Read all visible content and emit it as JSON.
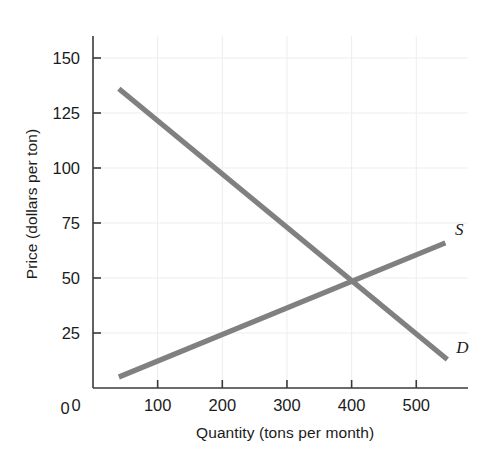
{
  "chart_data": {
    "type": "line",
    "title": "",
    "xlabel": "Quantity (tons per month)",
    "ylabel": "Price (dollars per ton)",
    "xlim": [
      0,
      580
    ],
    "ylim": [
      0,
      160
    ],
    "xticks": [
      "0",
      "100",
      "200",
      "300",
      "400",
      "500"
    ],
    "xtick_values": [
      0,
      100,
      200,
      300,
      400,
      500
    ],
    "yticks": [
      "0",
      "25",
      "50",
      "75",
      "100",
      "125",
      "150"
    ],
    "ytick_values": [
      0,
      25,
      50,
      75,
      100,
      125,
      150
    ],
    "grid": true,
    "legend_position": "inline-end-of-line",
    "series": [
      {
        "name": "S",
        "label": "S",
        "description": "Supply curve",
        "color": "#808080",
        "x": [
          40,
          545
        ],
        "y": [
          5,
          66
        ],
        "label_x": 560,
        "label_y": 72
      },
      {
        "name": "D",
        "label": "D",
        "description": "Demand curve",
        "color": "#808080",
        "x": [
          40,
          548
        ],
        "y": [
          136,
          13
        ],
        "label_x": 562,
        "label_y": 18
      }
    ],
    "annotations": [
      {
        "name": "equilibrium",
        "x": 400,
        "y": 50,
        "text": ""
      }
    ]
  },
  "colors": {
    "curve": "#808080",
    "axis": "#3a3a3a",
    "grid": "#ededf2",
    "text": "#1b1b1b",
    "background": "#ffffff"
  }
}
